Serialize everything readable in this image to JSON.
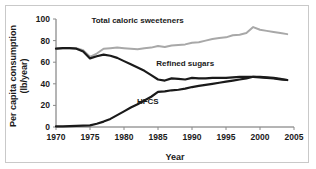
{
  "figure": {
    "background_color": "#ffffff",
    "border_color": "#c9c9c9"
  },
  "chart_data": {
    "type": "line",
    "title": "",
    "xlabel": "Year",
    "ylabel": "Per capita consumption (lb/year)",
    "ylabel_line1": "Per capita consumption",
    "ylabel_line2": "(lb/year)",
    "xlim": [
      1970,
      2005
    ],
    "ylim": [
      0,
      100
    ],
    "xticks": [
      1970,
      1975,
      1980,
      1985,
      1990,
      1995,
      2000,
      2005
    ],
    "yticks": [
      0,
      20,
      40,
      60,
      80,
      100
    ],
    "grid": false,
    "legend": "inline-labels",
    "x": [
      1970,
      1971,
      1972,
      1973,
      1974,
      1975,
      1976,
      1977,
      1978,
      1979,
      1980,
      1981,
      1982,
      1983,
      1984,
      1985,
      1986,
      1987,
      1988,
      1989,
      1990,
      1991,
      1992,
      1993,
      1994,
      1995,
      1996,
      1997,
      1998,
      1999,
      2000,
      2001,
      2002,
      2003,
      2004
    ],
    "series": [
      {
        "name": "Total caloric sweeteners",
        "color": "#a8a8a8",
        "width": 2.0,
        "label_x": 1982.0,
        "label_y": 96.0,
        "values": [
          72.5,
          73.0,
          73.2,
          73.0,
          71.0,
          65.0,
          68.0,
          72.5,
          73.0,
          73.5,
          73.0,
          72.5,
          72.0,
          73.0,
          73.5,
          75.0,
          74.0,
          75.5,
          76.0,
          76.5,
          78.0,
          78.5,
          80.0,
          81.5,
          82.5,
          83.0,
          85.0,
          85.5,
          87.0,
          92.5,
          90.0,
          89.0,
          88.0,
          87.0,
          86.0
        ]
      },
      {
        "name": "Refined sugars",
        "color": "#1a1a1a",
        "width": 2.2,
        "label_x": 1989.0,
        "label_y": 56.5,
        "values": [
          72.5,
          73.0,
          73.0,
          72.5,
          70.0,
          63.5,
          65.5,
          67.0,
          66.0,
          64.0,
          61.0,
          58.0,
          55.0,
          52.0,
          48.0,
          44.0,
          43.0,
          45.0,
          44.5,
          44.0,
          45.5,
          45.0,
          45.0,
          45.5,
          45.5,
          45.5,
          46.0,
          46.5,
          46.5,
          46.5,
          46.0,
          45.5,
          45.0,
          44.0,
          43.5
        ]
      },
      {
        "name": "HFCS",
        "color": "#1a1a1a",
        "width": 2.2,
        "label_x": 1983.5,
        "label_y": 21.0,
        "values": [
          0.5,
          0.6,
          0.8,
          1.0,
          1.2,
          1.5,
          3.0,
          5.0,
          7.5,
          11.0,
          14.5,
          18.0,
          21.0,
          24.5,
          28.0,
          32.5,
          33.0,
          34.0,
          34.5,
          35.5,
          37.0,
          38.0,
          39.0,
          40.0,
          41.0,
          42.0,
          43.0,
          44.0,
          45.0,
          46.5,
          46.5,
          46.0,
          45.5,
          44.5,
          43.5
        ]
      }
    ]
  }
}
